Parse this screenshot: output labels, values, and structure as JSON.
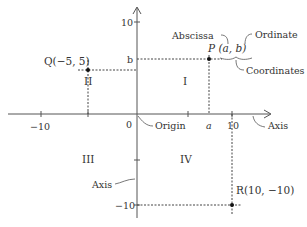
{
  "diagram": {
    "axes": {
      "x_ticks": [
        {
          "label": "−10",
          "value": -10
        },
        {
          "label": "0",
          "value": 0
        },
        {
          "label": "a",
          "value": "a"
        },
        {
          "label": "10",
          "value": 10
        }
      ],
      "y_ticks": [
        {
          "label": "10",
          "value": 10
        },
        {
          "label": "b",
          "value": "b"
        },
        {
          "label": "−10",
          "value": -10
        }
      ]
    },
    "quadrants": {
      "q1": "I",
      "q2": "II",
      "q3": "III",
      "q4": "IV"
    },
    "points": {
      "P": {
        "label": "P (a, b)",
        "x": "a",
        "y": "b"
      },
      "Q": {
        "label": "Q(−5, 5)",
        "x": -5,
        "y": 5
      },
      "R": {
        "label": "R(10, −10)",
        "x": 10,
        "y": -10
      }
    },
    "annotations": {
      "abscissa": "Abscissa",
      "ordinate": "Ordinate",
      "coordinates": "Coordinates",
      "origin": "Origin",
      "x_axis": "Axis",
      "y_axis": "Axis"
    },
    "colors": {
      "line": "#555555",
      "text": "#333333",
      "point": "#111111"
    }
  }
}
